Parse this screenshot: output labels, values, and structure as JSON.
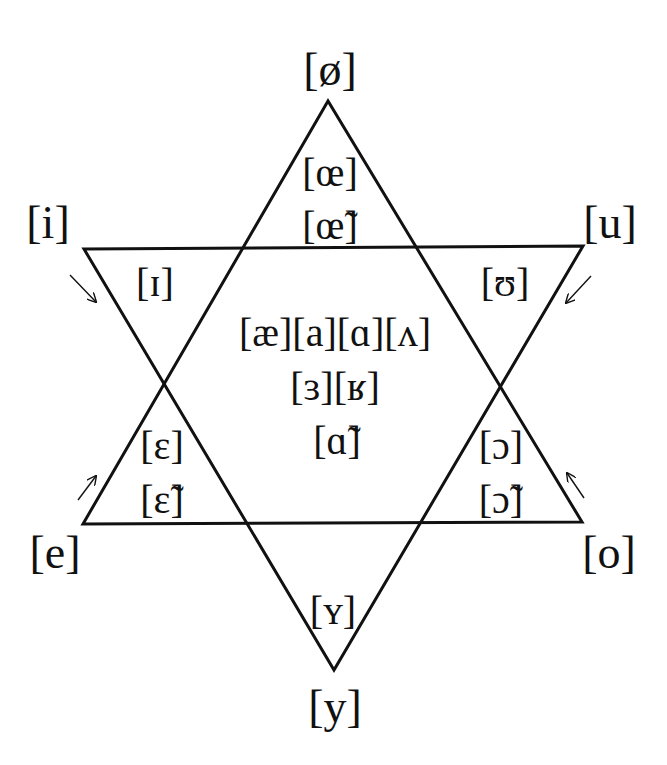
{
  "diagram": {
    "title": "",
    "colors": {
      "stroke": "#111111",
      "background": "#ffffff"
    },
    "triangles": {
      "upward": {
        "apex": [
          328,
          101
        ],
        "left": [
          83,
          524
        ],
        "right": [
          582,
          522
        ]
      },
      "downward": {
        "apex": [
          334,
          670
        ],
        "left": [
          84,
          249
        ],
        "right": [
          583,
          246
        ]
      }
    },
    "vertices": {
      "top": "[ø]",
      "top_left": "[i]",
      "top_right": "[u]",
      "bottom_left": "[e]",
      "bottom_right": "[o]",
      "bottom": "[y]"
    },
    "inner": {
      "top_1": "[œ]",
      "top_2": "[œ̃]",
      "upper_left": "[ɪ]",
      "upper_right": "[ʊ]",
      "center_1": "[æ][a][ɑ][ʌ]",
      "center_2": "[ɜ][ʁ]",
      "center_3": "[ɑ̃]",
      "lower_left_1": "[ɛ]",
      "lower_left_2": "[ɛ̃]",
      "lower_right_1": "[ɔ]",
      "lower_right_2": "[ɔ̃]",
      "bottom_inner": "[ʏ]"
    },
    "arrows": [
      {
        "name": "arrow-i-to-ɪ",
        "from": [
          70,
          275
        ],
        "to": [
          96,
          302
        ]
      },
      {
        "name": "arrow-u-to-ʊ",
        "from": [
          591,
          276
        ],
        "to": [
          566,
          303
        ]
      },
      {
        "name": "arrow-e-to-ɛ",
        "from": [
          78,
          500
        ],
        "to": [
          96,
          476
        ]
      },
      {
        "name": "arrow-o-to-ɔ",
        "from": [
          584,
          498
        ],
        "to": [
          567,
          473
        ]
      }
    ]
  }
}
